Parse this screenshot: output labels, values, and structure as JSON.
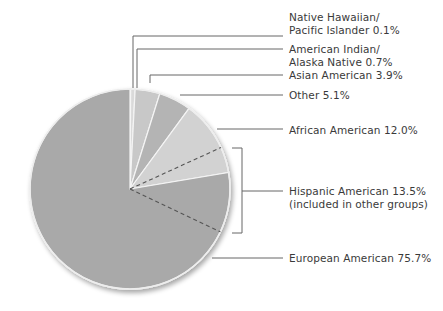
{
  "chart_data": {
    "type": "pie",
    "title": "",
    "center": [
      130,
      189
    ],
    "radius": 100,
    "start_angle_deg": 0,
    "direction": "clockwise",
    "slices": [
      {
        "name": "Native Hawaiian/ Pacific Islander",
        "value": 0.1,
        "color": "#e6e6e6"
      },
      {
        "name": "American Indian/ Alaska Native",
        "value": 0.7,
        "color": "#dadada"
      },
      {
        "name": "Asian American",
        "value": 3.9,
        "color": "#c8c8c8"
      },
      {
        "name": "Other",
        "value": 5.1,
        "color": "#b4b4b4"
      },
      {
        "name": "African American",
        "value": 12.0,
        "color": "#d2d2d2"
      },
      {
        "name": "European American",
        "value": 75.7,
        "color": "#a9a9a9"
      }
    ],
    "overlay": {
      "name": "Hispanic American",
      "value": 13.5,
      "note": "included in other groups",
      "style": "dashed",
      "start_angle_deg": 65.5
    },
    "legend_position": "right (leader-line labels)"
  },
  "labels": [
    {
      "id": "nh",
      "lines": [
        "Native Hawaiian/",
        "Pacific Islander  0.1%"
      ],
      "top": 11
    },
    {
      "id": "ai",
      "lines": [
        "American Indian/",
        "Alaska Native  0.7%"
      ],
      "top": 43
    },
    {
      "id": "as",
      "lines": [
        "Asian American  3.9%"
      ],
      "top": 69
    },
    {
      "id": "ot",
      "lines": [
        "Other  5.1%"
      ],
      "top": 89
    },
    {
      "id": "af",
      "lines": [
        "African American  12.0%"
      ],
      "top": 124
    },
    {
      "id": "hi",
      "lines": [
        "Hispanic American  13.5%",
        "(included in other groups)"
      ],
      "top": 185
    },
    {
      "id": "eu",
      "lines": [
        "European American  75.7%"
      ],
      "top": 252
    }
  ],
  "leaders": [
    {
      "id": "nh",
      "points": [
        [
          133,
          88
        ],
        [
          133,
          36
        ],
        [
          283,
          36
        ]
      ]
    },
    {
      "id": "ai",
      "points": [
        [
          137,
          88
        ],
        [
          137,
          49
        ],
        [
          283,
          49
        ]
      ]
    },
    {
      "id": "as",
      "points": [
        [
          150,
          83
        ],
        [
          150,
          75
        ],
        [
          283,
          75
        ]
      ]
    },
    {
      "id": "ot",
      "points": [
        [
          180,
          95
        ],
        [
          283,
          95
        ]
      ]
    },
    {
      "id": "af",
      "points": [
        [
          217,
          129
        ],
        [
          283,
          129
        ]
      ]
    },
    {
      "id": "hi",
      "points": [
        [
          232,
          148
        ],
        [
          242,
          148
        ],
        [
          242,
          233
        ],
        [
          232,
          233
        ]
      ],
      "branch": [
        [
          242,
          191
        ],
        [
          283,
          191
        ]
      ]
    },
    {
      "id": "eu",
      "points": [
        [
          212,
          258
        ],
        [
          283,
          258
        ]
      ]
    }
  ]
}
